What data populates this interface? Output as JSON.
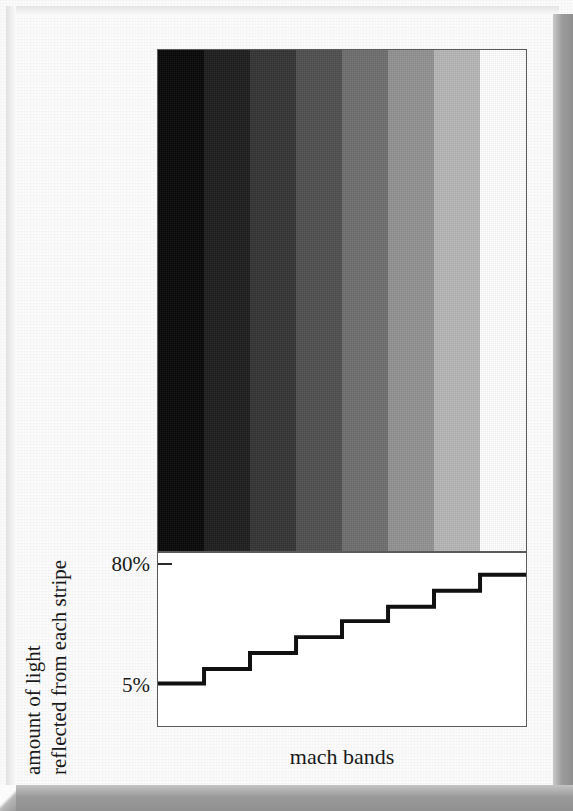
{
  "figure": {
    "caption": "mach bands",
    "y_axis_title_line_1": "amount of light",
    "y_axis_title_line_2": "reflected from each stripe"
  },
  "axis": {
    "tick_top_label": "80%",
    "tick_bottom_label": "5%"
  },
  "colors": {
    "page_background": "#fbfbfb",
    "panel_border": "#5a5a5a",
    "plot_line": "#111111",
    "bevel_shadow": "#9a9a9a",
    "text": "#1a1a1a"
  },
  "chart_data": {
    "type": "bar",
    "title": "mach bands",
    "xlabel": "mach bands",
    "ylabel": "amount of light reflected from each stripe",
    "categories": [
      "1",
      "2",
      "3",
      "4",
      "5",
      "6",
      "7",
      "8"
    ],
    "values": [
      5,
      15,
      26,
      37,
      48,
      58,
      69,
      80
    ],
    "ylim": [
      0,
      100
    ],
    "ytick_values": [
      5,
      80
    ],
    "ytick_labels": [
      "5%",
      "80%"
    ],
    "grid": false,
    "legend": null,
    "annotations": [
      "Staircase step plot showing luminance of each of the eight stripes.",
      "The stripes above are uniform in reflectance but appear to have bright and dark edges (Mach bands)."
    ],
    "stripe_colors": [
      "#070707",
      "#1d1d1d",
      "#343434",
      "#4f4f4f",
      "#6e6e6e",
      "#929292",
      "#b6b6b6",
      "#ffffff"
    ],
    "stripe_count": 8
  }
}
